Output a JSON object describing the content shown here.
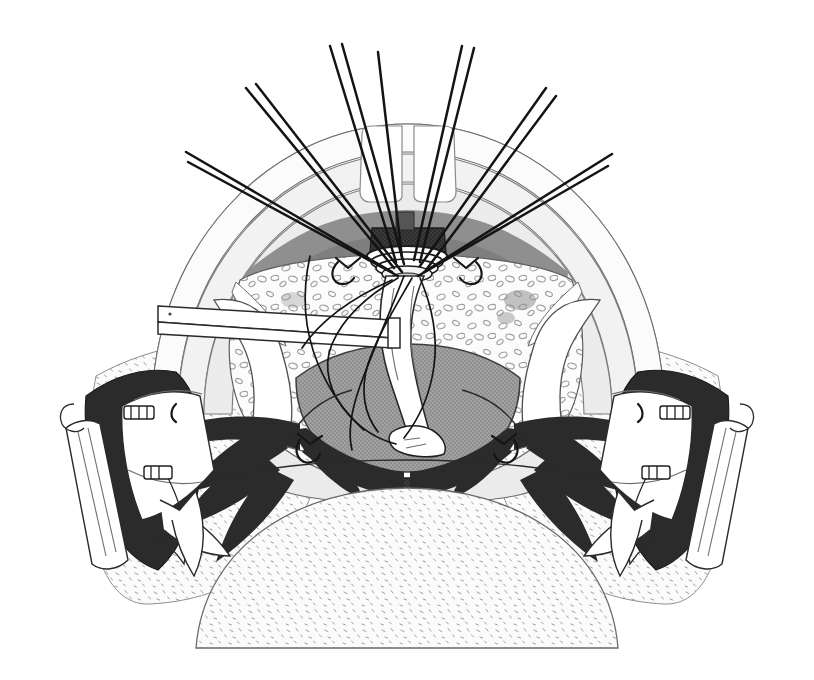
{
  "figure": {
    "title": "Surgical operative field illustration",
    "subject": "Transoral operative exposure with circumferential anastomosis and traction sutures",
    "style": "black-and-white stippled medical line art",
    "width": 814,
    "height": 680,
    "background_color": "#ffffff",
    "caption": ""
  },
  "palette": {
    "ink": "#1b1b1b",
    "hairline": "#6e6e6e",
    "paper": "#ffffff",
    "tissue_light": "#f4f4f4",
    "tissue_pale": "#ededed",
    "tissue_mid": "#9a9a9a",
    "tissue_dark": "#6f6f6f",
    "muscle_black": "#2b2b2b",
    "stipple_ink": "#8d8d95",
    "instrument_white": "#ffffff"
  },
  "structures": {
    "outer_arch": {
      "name": "outer mucosal arch",
      "fill": "#fbfbfb",
      "stroke": "#6e6e6e",
      "label": "Outer retracted arch"
    },
    "mid_arch": {
      "name": "middle arch band",
      "fill": "#f1f1f1",
      "stroke": "#7a7a7a",
      "label": "Middle arch band"
    },
    "inner_arch": {
      "name": "inner arch band",
      "fill": "#e8e8e8",
      "stroke": "#7a7a7a",
      "label": "Inner arch band"
    },
    "teeth": {
      "name": "upper central incisors",
      "count": 2,
      "fill": "#ffffff",
      "stroke": "#8a8a8a",
      "label": "Central incisors"
    },
    "dark_crescent": {
      "name": "dark superior crescent",
      "fill": "#8f8f8f",
      "label": "Superior mucosal crescent"
    },
    "stippled_field": {
      "name": "stippled submucosal field",
      "fill": "#f6f6f6",
      "label": "Stippled tissue field"
    },
    "central_mass": {
      "name": "central gray mass",
      "fill": "#9a9a9a",
      "stroke": "#3a3a3a",
      "label": "Central gray mass"
    },
    "lower_tongue": {
      "name": "inferior stippled dome",
      "fill": "#fafafa",
      "label": "Inferior stippled dome"
    },
    "midline_notch": {
      "name": "midline dark notch",
      "fill": "#3a3a3a",
      "label": "Midline notch"
    }
  },
  "instruments": {
    "suction_tube": {
      "name": "suction tube",
      "label": "Suction / irrigation tube",
      "side": "left",
      "color": "#ffffff"
    },
    "catheter": {
      "name": "central catheter",
      "label": "Indwelling catheter",
      "color": "#ffffff"
    },
    "retractor_left": {
      "name": "left retractor blade",
      "label": "Left retractor blade",
      "clip_count": 2
    },
    "retractor_right": {
      "name": "right retractor blade",
      "label": "Right retractor blade",
      "clip_count": 2
    },
    "anastomosis_ring": {
      "name": "anastomosis ring",
      "label": "Circumferential anastomosis ring",
      "ring_count": 4
    }
  },
  "sutures": {
    "label": "Radiating traction sutures",
    "total_strands": 13,
    "pairs": 6,
    "singles": 1,
    "color": "#141414",
    "strands": [
      {
        "id": "s1",
        "side": "left",
        "angle_deg": -62,
        "paired": true
      },
      {
        "id": "s2",
        "side": "left",
        "angle_deg": -58,
        "paired": true
      },
      {
        "id": "s3",
        "side": "left",
        "angle_deg": -44,
        "paired": true
      },
      {
        "id": "s4",
        "side": "left",
        "angle_deg": -40,
        "paired": true
      },
      {
        "id": "s5",
        "side": "left",
        "angle_deg": -18,
        "paired": true
      },
      {
        "id": "s6",
        "side": "left",
        "angle_deg": -13,
        "paired": true
      },
      {
        "id": "s7",
        "side": "mid",
        "angle_deg": -3,
        "paired": false
      },
      {
        "id": "s8",
        "side": "right",
        "angle_deg": 16,
        "paired": true
      },
      {
        "id": "s9",
        "side": "right",
        "angle_deg": 20,
        "paired": true
      },
      {
        "id": "s10",
        "side": "right",
        "angle_deg": 36,
        "paired": true
      },
      {
        "id": "s11",
        "side": "right",
        "angle_deg": 40,
        "paired": true
      },
      {
        "id": "s12",
        "side": "right",
        "angle_deg": 58,
        "paired": true
      },
      {
        "id": "s13",
        "side": "right",
        "angle_deg": 63,
        "paired": true
      }
    ]
  },
  "knots": {
    "label": "Tied suture knots on mucosal edge",
    "count": 6,
    "positions": [
      "left-upper",
      "right-upper",
      "left-mid",
      "right-mid",
      "left-lower",
      "right-lower"
    ]
  },
  "clips": {
    "label": "Retractor fixation clips",
    "count": 4
  }
}
